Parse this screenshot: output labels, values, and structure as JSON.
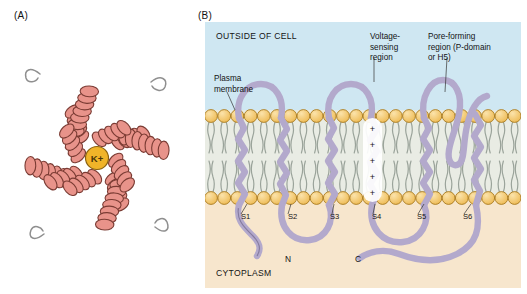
{
  "figure": {
    "panels": [
      {
        "id": "A",
        "letter": "(A)"
      },
      {
        "id": "B",
        "letter": "(B)"
      }
    ]
  },
  "panel_a": {
    "ion_label": "K+",
    "helix_color": "#e8938a",
    "helix_stroke": "#7a3b33",
    "ion_fill": "#f0b429",
    "ion_stroke": "#8a6210",
    "loop_color": "#8a8a8a",
    "subunit_count": 4
  },
  "panel_b": {
    "regions": {
      "outside": "OUTSIDE OF CELL",
      "cytoplasm": "CYTOPLASM"
    },
    "annotations": [
      {
        "name": "plasma-membrane",
        "text": "Plasma\nmembrane"
      },
      {
        "name": "voltage-sensing-region",
        "text": "Voltage-\nsensing\nregion"
      },
      {
        "name": "pore-forming-region",
        "text": "Pore-forming\nregion (P-domain\nor H5)"
      }
    ],
    "segments": [
      {
        "label": "S1",
        "x": 36
      },
      {
        "label": "S2",
        "x": 83
      },
      {
        "label": "S3",
        "x": 125
      },
      {
        "label": "S4",
        "x": 167
      },
      {
        "label": "S5",
        "x": 212
      },
      {
        "label": "S6",
        "x": 258
      }
    ],
    "termini": [
      {
        "label": "N",
        "x": 80,
        "y": 232
      },
      {
        "label": "C",
        "x": 150,
        "y": 232
      }
    ],
    "charges": [
      "+",
      "+",
      "+",
      "+",
      "+"
    ],
    "colors": {
      "extracellular_bg": "#cfe7f2",
      "cytoplasm_bg": "#f7e6cd",
      "membrane_head": "#f2c871",
      "membrane_head_stroke": "#a87b20",
      "membrane_tail": "#9aa39a",
      "membrane_bg": "#e9ece4",
      "protein_fill": "#b3a9cc",
      "protein_stroke": "#5e5478"
    }
  }
}
